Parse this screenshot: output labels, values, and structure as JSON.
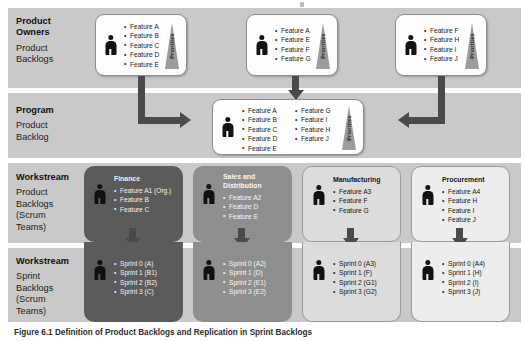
{
  "figure": {
    "caption": "Figure 6.1 Definition of Product Backlogs and Replication in Sprint Backlogs",
    "priorities_label": "Priorities"
  },
  "rows": [
    {
      "heading": "Product Owners",
      "heading_line1": "Product",
      "heading_line2": "Owners",
      "sublabel": "Product\nBacklogs"
    },
    {
      "heading": "Program",
      "heading_line1": "Program",
      "heading_line2": "",
      "sublabel": "Product\nBacklog"
    },
    {
      "heading": "Workstream",
      "heading_line1": "Workstream",
      "heading_line2": "",
      "sublabel": "Product\nBacklogs\n(Scrum\nTeams)"
    },
    {
      "heading": "Workstream",
      "heading_line1": "Workstream",
      "heading_line2": "",
      "sublabel": "Sprint\nBacklogs\n(Scrum\nTeams)"
    }
  ],
  "product_owner_backlogs": [
    {
      "id": "po-1",
      "features": [
        "Feature A",
        "Feature B",
        "Feature C",
        "Feature D",
        "Feature E"
      ]
    },
    {
      "id": "po-2",
      "features": [
        "Feature A",
        "Feature E",
        "Feature F",
        "Feature G"
      ]
    },
    {
      "id": "po-3",
      "features": [
        "Feature F",
        "Feature H",
        "Feature I",
        "Feature J"
      ]
    }
  ],
  "program_backlog": {
    "column_left": [
      "Feature A",
      "Feature B",
      "Feature C",
      "Feature D",
      "Feature E"
    ],
    "column_right": [
      "Feature G",
      "Feature I",
      "Feature H",
      "Feature J"
    ]
  },
  "workstream_product_backlogs": [
    {
      "title": "Finance",
      "shade": "dark",
      "features": [
        "Feature A1 (Org.)",
        "Feature B",
        "Feature C"
      ]
    },
    {
      "title": "Sales and Distribution",
      "shade": "mid",
      "features": [
        "Feature A2",
        "Feature D",
        "Feature E"
      ]
    },
    {
      "title": "Manufacturing",
      "shade": "light1",
      "features": [
        "Feature A3",
        "Feature F",
        "Feature G"
      ]
    },
    {
      "title": "Procurement",
      "shade": "light2",
      "features": [
        "Feature A4",
        "Feature H",
        "Feature I",
        "Feature J"
      ]
    }
  ],
  "workstream_sprint_backlogs": [
    {
      "shade": "dark",
      "sprints": [
        "Sprint 0 (A)",
        "Sprint 1 (B1)",
        "Sprint 2 (B2)",
        "Sprint 3 (C)"
      ]
    },
    {
      "shade": "mid",
      "sprints": [
        "Sprint 0 (A2)",
        "Sprint 1 (D)",
        "Sprint 2 (E1)",
        "Sprint 3 (E2)"
      ]
    },
    {
      "shade": "light1",
      "sprints": [
        "Sprint 0 (A3)",
        "Sprint 1 (F)",
        "Sprint 2 (G1)",
        "Sprint 3 (G2)"
      ]
    },
    {
      "shade": "light2",
      "sprints": [
        "Sprint 0 (A4)",
        "Sprint 1 (H)",
        "Sprint 2 (I)",
        "Sprint 3 (J)"
      ]
    }
  ],
  "colors": {
    "band": "#c9c9c9",
    "arrow": "#4a4a4a",
    "shade_dark": "#5b5b5b",
    "shade_mid": "#8e8e8e",
    "shade_light1": "#dcdcdc",
    "shade_light2": "#ededed"
  }
}
